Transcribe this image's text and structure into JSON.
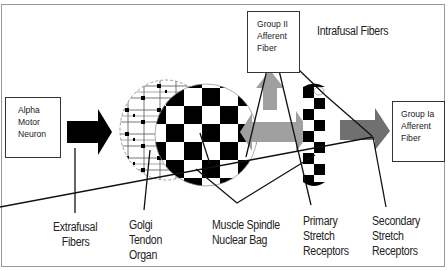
{
  "diagram": {
    "boxes": {
      "alpha_motor_neuron": [
        "Alpha",
        "Motor",
        "Neuron"
      ],
      "group_ii_afferent": [
        "Group II",
        "Afferent",
        "Fiber"
      ],
      "group_ia_afferent": [
        "Group Ia",
        "Afferent",
        "Fiber"
      ]
    },
    "labels": {
      "intrafusal_fibers": "Intrafusal Fibers",
      "extrafusal_fibers": [
        "Extrafusal",
        "Fibers"
      ],
      "golgi_tendon_organ": [
        "Golgi",
        "Tendon",
        "Organ"
      ],
      "muscle_spindle_nuclear_bag": [
        "Muscle Spindle",
        "Nuclear Bag"
      ],
      "primary_stretch_receptors": [
        "Primary",
        "Stretch",
        "Receptors"
      ],
      "secondary_stretch_receptors": [
        "Secondary",
        "Stretch",
        "Receptors"
      ]
    },
    "colors": {
      "black_arrow": "#000000",
      "light_gray_arrow": "#a0a0a0",
      "dark_gray_arrow": "#707070",
      "lines": "#111111",
      "frame": "#9a9a9a"
    }
  }
}
